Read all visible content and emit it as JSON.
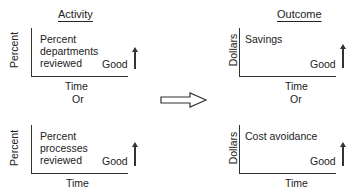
{
  "columns": {
    "left": {
      "title": "Activity"
    },
    "right": {
      "title": "Outcome"
    }
  },
  "panels": [
    {
      "id": "top-left",
      "ylabel": "Percent",
      "text": "Percent departments reviewed",
      "good_label": "Good",
      "xlabel": "Time"
    },
    {
      "id": "top-right",
      "ylabel": "Dollars",
      "text": "Savings",
      "good_label": "Good",
      "xlabel": "Time"
    },
    {
      "id": "bottom-left",
      "ylabel": "Percent",
      "text": "Percent processes reviewed",
      "good_label": "Good",
      "xlabel": "Time"
    },
    {
      "id": "bottom-right",
      "ylabel": "Dollars",
      "text": "Cost avoidance",
      "good_label": "Good",
      "xlabel": "Time"
    }
  ],
  "separators": {
    "left_or": "Or",
    "right_or": "Or"
  },
  "connector": {
    "icon": "hollow-right-arrow"
  }
}
